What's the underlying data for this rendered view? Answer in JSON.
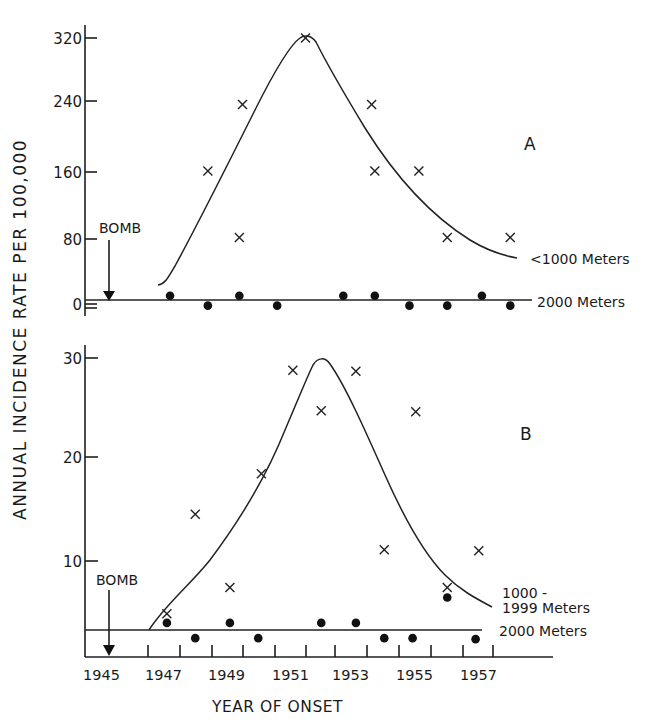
{
  "figure": {
    "ylabel": "ANNUAL INCIDENCE RATE PER 100,000",
    "xlabel": "YEAR OF ONSET",
    "bomb_label": "BOMB",
    "x_tick_labels": [
      "1945",
      "1947",
      "1949",
      "1951",
      "1953",
      "1955",
      "1957"
    ]
  },
  "chart_data": [
    {
      "type": "scatter",
      "panel": "A",
      "title": "A",
      "xlabel": "YEAR OF ONSET",
      "ylabel": "ANNUAL INCIDENCE RATE PER 100,000",
      "y_ticks": [
        0,
        80,
        160,
        240,
        320
      ],
      "ylim": [
        0,
        330
      ],
      "xlim": [
        1945,
        1958
      ],
      "annotations": [
        {
          "text": "BOMB",
          "x": 1945.6,
          "type": "arrow-down"
        }
      ],
      "series": [
        {
          "name": "<1000 Meters",
          "marker": "x",
          "fitted_curve": true,
          "points": [
            {
              "x": 1948.9,
              "y": 160
            },
            {
              "x": 1949.9,
              "y": 80
            },
            {
              "x": 1950.0,
              "y": 240
            },
            {
              "x": 1952.0,
              "y": 320
            },
            {
              "x": 1954.1,
              "y": 240
            },
            {
              "x": 1954.2,
              "y": 160
            },
            {
              "x": 1955.6,
              "y": 160
            },
            {
              "x": 1956.5,
              "y": 80
            },
            {
              "x": 1958.5,
              "y": 80
            }
          ]
        },
        {
          "name": "2000 Meters",
          "marker": "dot",
          "reference_line_y": 4,
          "points": [
            {
              "x": 1947.7,
              "y": 10
            },
            {
              "x": 1948.9,
              "y": -2
            },
            {
              "x": 1949.9,
              "y": 10
            },
            {
              "x": 1951.1,
              "y": -2
            },
            {
              "x": 1953.2,
              "y": 10
            },
            {
              "x": 1954.2,
              "y": 10
            },
            {
              "x": 1955.3,
              "y": -2
            },
            {
              "x": 1956.5,
              "y": -2
            },
            {
              "x": 1957.6,
              "y": 10
            },
            {
              "x": 1958.5,
              "y": -2
            }
          ]
        }
      ]
    },
    {
      "type": "scatter",
      "panel": "B",
      "title": "B",
      "xlabel": "YEAR OF ONSET",
      "ylabel": "ANNUAL INCIDENCE RATE PER 100,000",
      "y_ticks": [
        10,
        20,
        30
      ],
      "ylim": [
        0,
        31
      ],
      "xlim": [
        1945,
        1958
      ],
      "x_ticks": [
        1945,
        1947,
        1949,
        1951,
        1953,
        1955,
        1957
      ],
      "annotations": [
        {
          "text": "BOMB",
          "x": 1945.6,
          "type": "arrow-down"
        }
      ],
      "series": [
        {
          "name": "1000-1999 Meters",
          "marker": "x",
          "fitted_curve": true,
          "points": [
            {
              "x": 1947.6,
              "y": 4.8
            },
            {
              "x": 1948.5,
              "y": 14.6
            },
            {
              "x": 1949.6,
              "y": 7.4
            },
            {
              "x": 1950.6,
              "y": 18.6
            },
            {
              "x": 1951.6,
              "y": 28.8
            },
            {
              "x": 1952.5,
              "y": 24.8
            },
            {
              "x": 1953.6,
              "y": 28.7
            },
            {
              "x": 1954.5,
              "y": 11.1
            },
            {
              "x": 1955.5,
              "y": 24.7
            },
            {
              "x": 1956.5,
              "y": 7.4
            },
            {
              "x": 1957.5,
              "y": 11.0
            }
          ]
        },
        {
          "name": "2000 Meters",
          "marker": "dot",
          "reference_line_y": 3.2,
          "points": [
            {
              "x": 1947.6,
              "y": 3.9
            },
            {
              "x": 1948.5,
              "y": 2.4
            },
            {
              "x": 1949.6,
              "y": 3.9
            },
            {
              "x": 1950.5,
              "y": 2.4
            },
            {
              "x": 1952.5,
              "y": 3.9
            },
            {
              "x": 1953.6,
              "y": 3.9
            },
            {
              "x": 1954.5,
              "y": 2.4
            },
            {
              "x": 1955.4,
              "y": 2.4
            },
            {
              "x": 1956.5,
              "y": 6.4
            },
            {
              "x": 1957.4,
              "y": 2.3
            }
          ]
        }
      ]
    }
  ],
  "labels": {
    "panel_a": "A",
    "panel_b": "B",
    "a_series_1": "<1000 Meters",
    "a_series_2": "2000 Meters",
    "b_series_1_line1": "1000 -",
    "b_series_1_line2": "1999 Meters",
    "b_series_2": "2000 Meters",
    "a_ticks": [
      "320",
      "240",
      "160",
      "80",
      "0"
    ],
    "b_ticks": [
      "30",
      "20",
      "10"
    ]
  }
}
